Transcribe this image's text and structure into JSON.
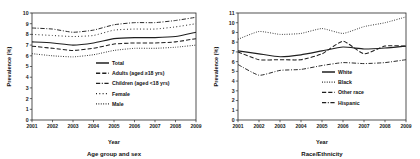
{
  "figure": {
    "background": "#ffffff",
    "ink": "#1a1a1a",
    "panel_count": 2
  },
  "chart_data": [
    {
      "type": "line",
      "title": "",
      "subtitle": "Age group and sex",
      "xlabel": "Year",
      "ylabel": "Prevalence (%)",
      "x": [
        2001,
        2002,
        2003,
        2004,
        2005,
        2006,
        2007,
        2008,
        2009
      ],
      "categories": [
        "2001",
        "2002",
        "2003",
        "2004",
        "2005",
        "2006",
        "2007",
        "2008",
        "2009"
      ],
      "xlim": [
        2001,
        2009
      ],
      "ylim": [
        0,
        10
      ],
      "yticks": [
        0,
        1,
        2,
        3,
        4,
        5,
        6,
        7,
        8,
        9,
        10
      ],
      "grid": false,
      "legend_position": "center-right-inside",
      "series": [
        {
          "name": "Total",
          "style": "solid",
          "color": "#1f1f1f",
          "values": [
            7.3,
            7.2,
            7.0,
            7.2,
            7.6,
            7.7,
            7.7,
            7.8,
            8.2
          ]
        },
        {
          "name": "Adults (aged ≥18 yrs)",
          "style": "dashed",
          "color": "#1f1f1f",
          "values": [
            6.9,
            6.7,
            6.5,
            6.7,
            7.1,
            7.2,
            7.2,
            7.3,
            7.6
          ]
        },
        {
          "name": "Children (aged <18 yrs)",
          "style": "dash-dot",
          "color": "#1f1f1f",
          "values": [
            8.6,
            8.5,
            8.2,
            8.4,
            8.9,
            9.1,
            9.1,
            9.3,
            9.6
          ]
        },
        {
          "name": "Female",
          "style": "sparse-dotted",
          "color": "#1f1f1f",
          "values": [
            8.0,
            7.9,
            7.8,
            7.9,
            8.4,
            8.5,
            8.5,
            8.7,
            9.0
          ]
        },
        {
          "name": "Male",
          "style": "dotted",
          "color": "#1f1f1f",
          "values": [
            6.2,
            6.0,
            5.9,
            6.1,
            6.5,
            6.7,
            6.7,
            6.8,
            7.0
          ]
        }
      ]
    },
    {
      "type": "line",
      "title": "",
      "subtitle": "Race/Ethnicity",
      "xlabel": "Year",
      "ylabel": "Prevalence (%)",
      "x": [
        2001,
        2002,
        2003,
        2004,
        2005,
        2006,
        2007,
        2008,
        2009
      ],
      "categories": [
        "2001",
        "2002",
        "2003",
        "2004",
        "2005",
        "2006",
        "2007",
        "2008",
        "2009"
      ],
      "xlim": [
        2001,
        2009
      ],
      "ylim": [
        0,
        11
      ],
      "yticks": [
        0,
        1,
        2,
        3,
        4,
        5,
        6,
        7,
        8,
        9,
        10,
        11
      ],
      "grid": false,
      "legend_position": "center-right-inside",
      "series": [
        {
          "name": "White",
          "style": "solid",
          "color": "#1f1f1f",
          "values": [
            7.1,
            6.8,
            6.5,
            6.7,
            7.1,
            7.5,
            7.3,
            7.4,
            7.6
          ]
        },
        {
          "name": "Black",
          "style": "dotted",
          "color": "#1f1f1f",
          "values": [
            8.3,
            9.1,
            8.8,
            8.9,
            9.4,
            8.9,
            9.6,
            10.0,
            10.6
          ]
        },
        {
          "name": "Other race",
          "style": "dashed",
          "color": "#1f1f1f",
          "values": [
            7.0,
            6.2,
            6.2,
            6.2,
            6.8,
            8.1,
            6.8,
            7.6,
            7.6
          ]
        },
        {
          "name": "Hispanic",
          "style": "dash-dot",
          "color": "#1f1f1f",
          "values": [
            5.7,
            4.6,
            5.1,
            5.2,
            5.6,
            5.9,
            5.8,
            5.9,
            6.2
          ]
        }
      ]
    }
  ]
}
